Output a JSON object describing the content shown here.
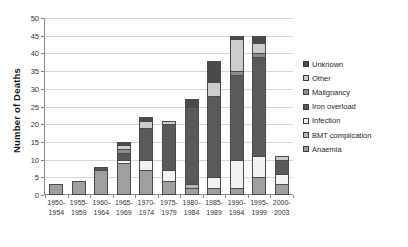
{
  "chart_data": {
    "type": "bar",
    "subtype": "stacked-bar",
    "title": "",
    "xlabel": "",
    "ylabel": "Number of Deaths",
    "ylim": [
      0,
      50
    ],
    "ytick_step": 5,
    "yticks": [
      "0",
      "5",
      "10",
      "15",
      "20",
      "25",
      "30",
      "35",
      "40",
      "45",
      "50"
    ],
    "grid": true,
    "legend_position": "right",
    "categories": [
      "1950-\n1954",
      "1955-\n1959",
      "1960-\n1964",
      "1965-\n1969",
      "1970-\n1974",
      "1975-\n1979",
      "1980-\n1984",
      "1985-\n1989",
      "1990-\n1994",
      "1995-\n1999",
      "2000-\n2003"
    ],
    "category_lines": [
      [
        "1950-",
        "1954"
      ],
      [
        "1955-",
        "1959"
      ],
      [
        "1960-",
        "1964"
      ],
      [
        "1965-",
        "1969"
      ],
      [
        "1970-",
        "1974"
      ],
      [
        "1975-",
        "1979"
      ],
      [
        "1980-",
        "1984"
      ],
      [
        "1985-",
        "1989"
      ],
      [
        "1990-",
        "1994"
      ],
      [
        "1995-",
        "1999"
      ],
      [
        "2000-",
        "2003"
      ]
    ],
    "series": [
      {
        "name": "Anaemia",
        "color": "#9f9f9f",
        "values": [
          3,
          4,
          7,
          9,
          7,
          4,
          2,
          2,
          2,
          5,
          3
        ]
      },
      {
        "name": "BMT complication",
        "color": "#b5b5b5",
        "values": [
          0,
          0,
          0,
          0,
          0,
          0,
          1,
          0,
          0,
          0,
          0
        ]
      },
      {
        "name": "Infection",
        "color": "#f2f2f2",
        "values": [
          0,
          0,
          0,
          1,
          3,
          3,
          0,
          3,
          8,
          6,
          3
        ]
      },
      {
        "name": "Iron overload",
        "color": "#595959",
        "values": [
          0,
          0,
          1,
          2,
          9,
          13,
          22,
          23,
          24,
          28,
          4
        ]
      },
      {
        "name": "Malignancy",
        "color": "#8c8c8c",
        "values": [
          0,
          0,
          0,
          1,
          0,
          0,
          0,
          0,
          1,
          1,
          0
        ]
      },
      {
        "name": "Other",
        "color": "#cccccc",
        "values": [
          0,
          0,
          0,
          1,
          2,
          1,
          0,
          4,
          9,
          3,
          1
        ]
      },
      {
        "name": "Unknown",
        "color": "#4a4a4a",
        "values": [
          0,
          0,
          0,
          1,
          1,
          0,
          2,
          6,
          1,
          2,
          0
        ]
      }
    ],
    "totals": [
      3,
      4,
      8,
      15,
      22,
      21,
      27,
      38,
      45,
      45,
      11
    ]
  },
  "legend": {
    "items": [
      {
        "label": "Unknown",
        "color": "#4a4a4a"
      },
      {
        "label": "Other",
        "color": "#cccccc"
      },
      {
        "label": "Malignancy",
        "color": "#8c8c8c"
      },
      {
        "label": "Iron overload",
        "color": "#595959"
      },
      {
        "label": "Infection",
        "color": "#f2f2f2"
      },
      {
        "label": "BMT complication",
        "color": "#b5b5b5"
      },
      {
        "label": "Anaemia",
        "color": "#9f9f9f"
      }
    ]
  },
  "axes": {
    "y_title": "Number of Deaths"
  }
}
